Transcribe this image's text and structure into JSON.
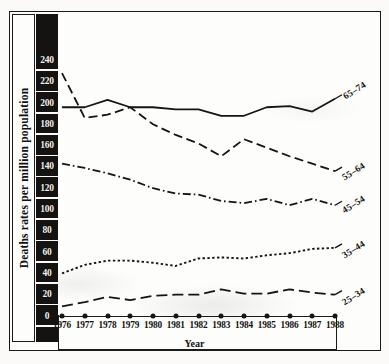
{
  "chart_data": {
    "type": "line",
    "title": "",
    "xlabel": "Year",
    "ylabel": "Deaths rates per million population",
    "x": [
      1976,
      1977,
      1978,
      1979,
      1980,
      1981,
      1982,
      1983,
      1984,
      1985,
      1986,
      1987,
      1988
    ],
    "xtick_labels": [
      "1976",
      "1977",
      "1978",
      "1979",
      "1980",
      "1981",
      "1982",
      "1983",
      "1984",
      "1985",
      "1986",
      "1987",
      "1988"
    ],
    "ytick_labels": [
      "240",
      "220",
      "200",
      "180",
      "160",
      "140",
      "120",
      "100",
      "80",
      "60",
      "40",
      "20",
      "0"
    ],
    "ytick_values": [
      240,
      220,
      200,
      180,
      160,
      140,
      120,
      100,
      80,
      60,
      40,
      20,
      0
    ],
    "ylim": [
      0,
      250
    ],
    "xlim": [
      1976,
      1988
    ],
    "grid": false,
    "legend_position": "line-end-labels",
    "series": [
      {
        "name": "65-74",
        "label": "65–74",
        "linestyle": "solid",
        "color": "#151515",
        "values": [
          196,
          196,
          203,
          196,
          196,
          194,
          194,
          188,
          188,
          196,
          197,
          192,
          204
        ]
      },
      {
        "name": "55-64",
        "label": "55–64",
        "linestyle": "dashed",
        "color": "#151515",
        "values": [
          228,
          186,
          189,
          196,
          180,
          170,
          162,
          150,
          166,
          158,
          150,
          143,
          136
        ]
      },
      {
        "name": "45-54",
        "label": "45–54",
        "linestyle": "dashdot",
        "color": "#151515",
        "values": [
          143,
          139,
          134,
          128,
          120,
          115,
          114,
          108,
          106,
          110,
          104,
          110,
          104
        ]
      },
      {
        "name": "35-44",
        "label": "35–44",
        "linestyle": "dotted",
        "color": "#151515",
        "values": [
          40,
          48,
          52,
          52,
          50,
          47,
          54,
          55,
          54,
          57,
          59,
          63,
          64
        ]
      },
      {
        "name": "25-34",
        "label": "25–34",
        "linestyle": "longdash",
        "color": "#151515",
        "values": [
          9,
          13,
          18,
          15,
          19,
          20,
          20,
          25,
          21,
          21,
          25,
          22,
          20
        ]
      }
    ]
  },
  "axis": {
    "y_title": "Deaths rates per million population",
    "x_title": "Year"
  }
}
